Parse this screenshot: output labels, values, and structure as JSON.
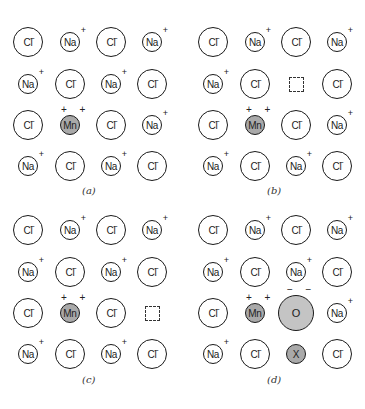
{
  "figure": {
    "colors": {
      "outline": "#1a1a1a",
      "dopant_fill": "#a9a9a9",
      "oxygen_fill": "#c4c4c4"
    },
    "panels": [
      {
        "id": "a",
        "label": "(a)",
        "grid": [
          [
            "Cl-",
            "Na+",
            "Cl-",
            "Na+"
          ],
          [
            "Na+",
            "Cl-",
            "Na+",
            "Cl-"
          ],
          [
            "Cl-",
            "Mn++",
            "Cl-",
            "Na+"
          ],
          [
            "Na+",
            "Cl-",
            "Na+",
            "Cl-"
          ]
        ]
      },
      {
        "id": "b",
        "label": "(b)",
        "grid": [
          [
            "Cl-",
            "Na+",
            "Cl-",
            "Na+"
          ],
          [
            "Na+",
            "Cl-",
            "vacancy",
            "Cl-"
          ],
          [
            "Cl-",
            "Mn++",
            "Cl-",
            "Na+"
          ],
          [
            "Na+",
            "Cl-",
            "Na+",
            "Cl-"
          ]
        ]
      },
      {
        "id": "c",
        "label": "(c)",
        "grid": [
          [
            "Cl-",
            "Na+",
            "Cl-",
            "Na+"
          ],
          [
            "Na+",
            "Cl-",
            "Na+",
            "Cl-"
          ],
          [
            "Cl-",
            "Mn++",
            "Cl-",
            "vacancy"
          ],
          [
            "Na+",
            "Cl-",
            "Na+",
            "Cl-"
          ]
        ]
      },
      {
        "id": "d",
        "label": "(d)",
        "grid": [
          [
            "Cl-",
            "Na+",
            "Cl-",
            "Na+"
          ],
          [
            "Na+",
            "Cl-",
            "Na+",
            "Cl-"
          ],
          [
            "Cl-",
            "Mn++",
            "O--",
            "Na+"
          ],
          [
            "Na+",
            "Cl-",
            "X",
            "Cl-"
          ]
        ]
      }
    ],
    "ion_text": {
      "cl": {
        "symbol": "Cl",
        "charge": "−"
      },
      "na": {
        "symbol": "Na",
        "charge": "+"
      },
      "mn": {
        "symbol": "Mn",
        "charge": "+ +"
      },
      "o": {
        "symbol": "O",
        "charge": "− −"
      },
      "x": {
        "symbol": "X",
        "charge": ""
      }
    }
  }
}
